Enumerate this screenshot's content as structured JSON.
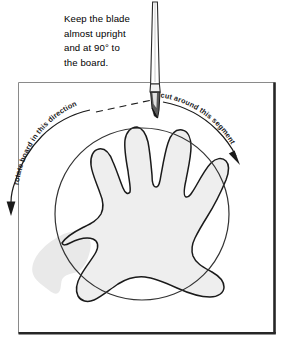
{
  "diagram": {
    "instruction_note": "Keep the blade\nalmost upright\nand at 90° to\nthe board.",
    "labels": {
      "rotate_direction": "rotate board in this direction",
      "cut_segment": "cut around this segment"
    },
    "icons": {
      "knife": "craft-knife-icon",
      "rotate_arrow": "rotate-arrow-icon",
      "cut_arrow": "cut-arrow-icon",
      "dashed_guide": "dashed-guide-line-icon"
    },
    "colors": {
      "outline": "#1a1a1a",
      "board_fill": "#ffffff",
      "board_edge_dark": "#262626",
      "board_edge_light": "#888888",
      "hand_fill": "#eeeeee",
      "hand_outline": "#1a1a1a",
      "circle_outline": "#333333",
      "knife_blade": "#4d4d4d",
      "knife_handle": "#ffffff",
      "shadow_fill": "#e8e8e8"
    },
    "shapes": {
      "board": {
        "x": 18,
        "y": 82,
        "width": 258,
        "height": 252
      },
      "circle": {
        "cx": 142,
        "cy": 214,
        "rx": 87,
        "ry": 86
      },
      "knife": {
        "tip_x": 157,
        "tip_y": 118,
        "top_y": 2
      }
    },
    "angle_value": "90°"
  }
}
